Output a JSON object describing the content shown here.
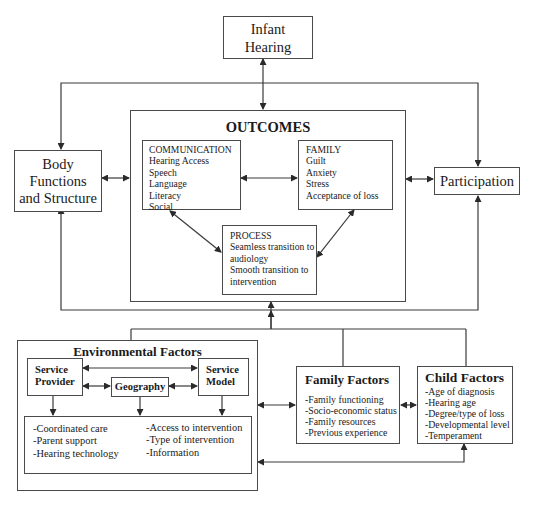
{
  "infant_hearing": {
    "label_lines": [
      "Infant",
      "Hearing"
    ]
  },
  "body_functions": {
    "label_lines": [
      "Body",
      "Functions",
      "and Structure"
    ]
  },
  "participation": {
    "label": "Participation"
  },
  "outcomes": {
    "title": "OUTCOMES",
    "communication": {
      "heading": "COMMUNICATION",
      "items": [
        "Hearing Access",
        "Speech",
        "Language",
        "Literacy",
        "Social"
      ]
    },
    "family": {
      "heading": "FAMILY",
      "items": [
        "Guilt",
        "Anxiety",
        "Stress",
        "Acceptance of loss"
      ]
    },
    "process": {
      "heading": "PROCESS",
      "items": [
        "Seamless transition to",
        "audiology",
        "Smooth transition to",
        "intervention"
      ]
    }
  },
  "environmental_factors": {
    "title": "Environmental Factors",
    "service_provider": {
      "label_lines": [
        "Service",
        "Provider"
      ]
    },
    "geography": {
      "label": "Geography"
    },
    "service_model": {
      "label_lines": [
        "Service",
        "Model"
      ]
    },
    "left_items": [
      "-Coordinated care",
      "-Parent support",
      "-Hearing technology"
    ],
    "right_items": [
      "-Access to intervention",
      "-Type of intervention",
      "-Information"
    ]
  },
  "family_factors": {
    "title": "Family Factors",
    "items": [
      "-Family functioning",
      "-Socio-economic status",
      "-Family resources",
      "-Previous experience"
    ]
  },
  "child_factors": {
    "title": "Child Factors",
    "items": [
      "-Age of diagnosis",
      "-Hearing age",
      "-Degree/type of loss",
      "-Developmental level",
      "-Temperament"
    ]
  },
  "colors": {
    "line": "#3a3a3a",
    "background": "#ffffff"
  }
}
